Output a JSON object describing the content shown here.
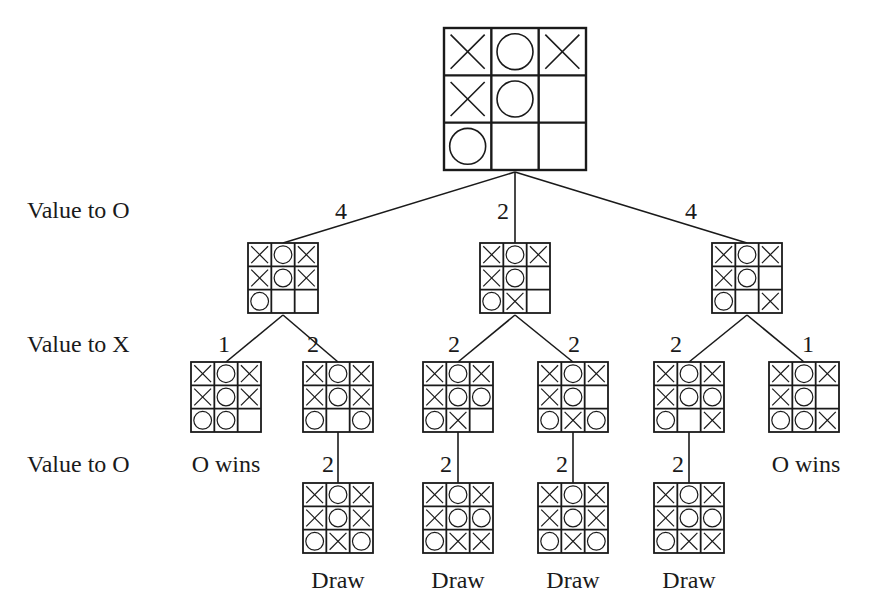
{
  "diagram": {
    "type": "game-tree",
    "row_labels": [
      {
        "text": "Value to O",
        "y": 198
      },
      {
        "text": "Value to X",
        "y": 332
      },
      {
        "text": "Value to O",
        "y": 452
      }
    ],
    "colors": {
      "line": "#1a1a1a",
      "background": "#ffffff"
    },
    "nodes": [
      {
        "id": "root",
        "x": 444,
        "y": 28,
        "size": 142,
        "board": [
          "X",
          "O",
          "X",
          "X",
          "O",
          "",
          "O",
          "",
          ""
        ]
      },
      {
        "id": "l1a",
        "x": 248,
        "y": 243,
        "size": 70,
        "board": [
          "X",
          "O",
          "X",
          "X",
          "O",
          "X",
          "O",
          "",
          ""
        ]
      },
      {
        "id": "l1b",
        "x": 480,
        "y": 243,
        "size": 70,
        "board": [
          "X",
          "O",
          "X",
          "X",
          "O",
          "",
          "O",
          "X",
          ""
        ]
      },
      {
        "id": "l1c",
        "x": 712,
        "y": 243,
        "size": 70,
        "board": [
          "X",
          "O",
          "X",
          "X",
          "O",
          "",
          "O",
          "",
          "X"
        ]
      },
      {
        "id": "l2a",
        "x": 191,
        "y": 362,
        "size": 70,
        "board": [
          "X",
          "O",
          "X",
          "X",
          "O",
          "X",
          "O",
          "O",
          ""
        ]
      },
      {
        "id": "l2b",
        "x": 303,
        "y": 362,
        "size": 70,
        "board": [
          "X",
          "O",
          "X",
          "X",
          "O",
          "X",
          "O",
          "",
          "O"
        ]
      },
      {
        "id": "l2c",
        "x": 423,
        "y": 362,
        "size": 70,
        "board": [
          "X",
          "O",
          "X",
          "X",
          "O",
          "O",
          "O",
          "X",
          ""
        ]
      },
      {
        "id": "l2d",
        "x": 538,
        "y": 362,
        "size": 70,
        "board": [
          "X",
          "O",
          "X",
          "X",
          "O",
          "",
          "O",
          "X",
          "O"
        ]
      },
      {
        "id": "l2e",
        "x": 654,
        "y": 362,
        "size": 70,
        "board": [
          "X",
          "O",
          "X",
          "X",
          "O",
          "O",
          "O",
          "",
          "X"
        ]
      },
      {
        "id": "l2f",
        "x": 769,
        "y": 362,
        "size": 70,
        "board": [
          "X",
          "O",
          "X",
          "X",
          "O",
          "",
          "O",
          "O",
          "X"
        ]
      },
      {
        "id": "l3a",
        "x": 303,
        "y": 483,
        "size": 70,
        "board": [
          "X",
          "O",
          "X",
          "X",
          "O",
          "X",
          "O",
          "X",
          "O"
        ]
      },
      {
        "id": "l3b",
        "x": 423,
        "y": 483,
        "size": 70,
        "board": [
          "X",
          "O",
          "X",
          "X",
          "O",
          "O",
          "O",
          "X",
          "X"
        ]
      },
      {
        "id": "l3c",
        "x": 538,
        "y": 483,
        "size": 70,
        "board": [
          "X",
          "O",
          "X",
          "X",
          "O",
          "X",
          "O",
          "X",
          "O"
        ]
      },
      {
        "id": "l3d",
        "x": 654,
        "y": 483,
        "size": 70,
        "board": [
          "X",
          "O",
          "X",
          "X",
          "O",
          "O",
          "O",
          "X",
          "X"
        ]
      }
    ],
    "edges": [
      {
        "from": "root",
        "to": "l1a",
        "x1": 515,
        "y1": 172,
        "x2": 283,
        "y2": 243,
        "label": "4",
        "lx": 341,
        "ly": 199
      },
      {
        "from": "root",
        "to": "l1b",
        "x1": 515,
        "y1": 172,
        "x2": 515,
        "y2": 243,
        "label": "2",
        "lx": 503,
        "ly": 199
      },
      {
        "from": "root",
        "to": "l1c",
        "x1": 515,
        "y1": 172,
        "x2": 747,
        "y2": 243,
        "label": "4",
        "lx": 691,
        "ly": 199
      },
      {
        "from": "l1a",
        "to": "l2a",
        "x1": 283,
        "y1": 315,
        "x2": 226,
        "y2": 362,
        "label": "1",
        "lx": 224,
        "ly": 332
      },
      {
        "from": "l1a",
        "to": "l2b",
        "x1": 283,
        "y1": 315,
        "x2": 338,
        "y2": 362,
        "label": "2",
        "lx": 313,
        "ly": 332
      },
      {
        "from": "l1b",
        "to": "l2c",
        "x1": 515,
        "y1": 315,
        "x2": 458,
        "y2": 362,
        "label": "2",
        "lx": 454,
        "ly": 332
      },
      {
        "from": "l1b",
        "to": "l2d",
        "x1": 515,
        "y1": 315,
        "x2": 573,
        "y2": 362,
        "label": "2",
        "lx": 574,
        "ly": 332
      },
      {
        "from": "l1c",
        "to": "l2e",
        "x1": 747,
        "y1": 315,
        "x2": 689,
        "y2": 362,
        "label": "2",
        "lx": 676,
        "ly": 332
      },
      {
        "from": "l1c",
        "to": "l2f",
        "x1": 747,
        "y1": 315,
        "x2": 804,
        "y2": 362,
        "label": "1",
        "lx": 808,
        "ly": 332
      },
      {
        "from": "l2b",
        "to": "l3a",
        "x1": 338,
        "y1": 432,
        "x2": 338,
        "y2": 483,
        "label": "2",
        "lx": 328,
        "ly": 452
      },
      {
        "from": "l2c",
        "to": "l3b",
        "x1": 458,
        "y1": 432,
        "x2": 458,
        "y2": 483,
        "label": "2",
        "lx": 446,
        "ly": 452
      },
      {
        "from": "l2d",
        "to": "l3c",
        "x1": 573,
        "y1": 432,
        "x2": 573,
        "y2": 483,
        "label": "2",
        "lx": 562,
        "ly": 452
      },
      {
        "from": "l2e",
        "to": "l3d",
        "x1": 689,
        "y1": 432,
        "x2": 689,
        "y2": 483,
        "label": "2",
        "lx": 678,
        "ly": 452
      }
    ],
    "outcomes": [
      {
        "node": "l2a",
        "text": "O wins",
        "x": 226,
        "y": 452
      },
      {
        "node": "l2f",
        "text": "O wins",
        "x": 806,
        "y": 452
      },
      {
        "node": "l3a",
        "text": "Draw",
        "x": 338,
        "y": 568
      },
      {
        "node": "l3b",
        "text": "Draw",
        "x": 458,
        "y": 568
      },
      {
        "node": "l3c",
        "text": "Draw",
        "x": 573,
        "y": 568
      },
      {
        "node": "l3d",
        "text": "Draw",
        "x": 689,
        "y": 568
      }
    ]
  }
}
